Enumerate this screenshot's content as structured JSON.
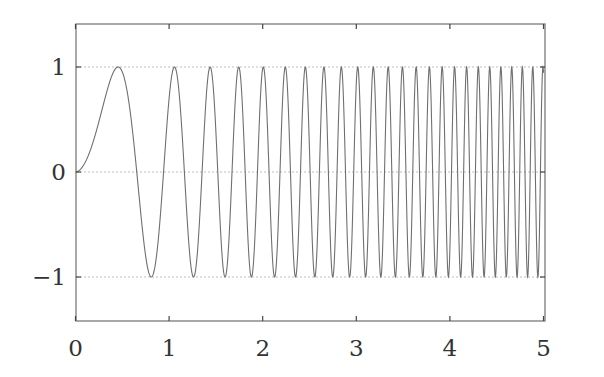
{
  "chart_data": {
    "type": "line",
    "title": "",
    "xlabel": "",
    "ylabel": "",
    "xlim": [
      0,
      5
    ],
    "ylim": [
      -1.41,
      1.42
    ],
    "grid": {
      "y": true,
      "x": false,
      "style": "dashed"
    },
    "legend": null,
    "x_ticks": [
      0,
      1,
      2,
      3,
      4,
      5
    ],
    "x_tick_labels": [
      "0",
      "1",
      "2",
      "3",
      "4",
      "5"
    ],
    "y_ticks": [
      -1,
      0,
      1
    ],
    "y_tick_labels": [
      "−1",
      "0",
      "1"
    ],
    "series": [
      {
        "name": "chirp",
        "description": "y = sin(a * x^p), a chirp with increasing frequency",
        "a": 7.06,
        "p": 1.91,
        "x_range": [
          0,
          5
        ],
        "samples": 2500,
        "color": "#6f6f6f",
        "peak_x_positions": [
          0.455,
          1.07,
          1.45,
          1.75,
          2.0,
          2.24,
          2.45,
          2.65,
          2.83,
          3.0,
          3.17,
          3.33,
          3.47,
          3.61,
          3.75,
          3.88,
          3.99,
          4.11,
          4.24,
          4.36,
          4.47,
          4.58,
          4.7,
          4.83,
          4.97
        ]
      }
    ]
  },
  "colors": {
    "frame": "#7a7a7a",
    "grid": "#b5b5b5",
    "line": "#6f6f6f",
    "text": "#333333"
  },
  "layout": {
    "plot_left": 76,
    "plot_right": 545,
    "plot_top": 24,
    "plot_bottom": 321,
    "x0_px": 75.5,
    "x_px_per_unit": 93.6,
    "y0_px": 172,
    "y_px_per_unit": 105
  }
}
